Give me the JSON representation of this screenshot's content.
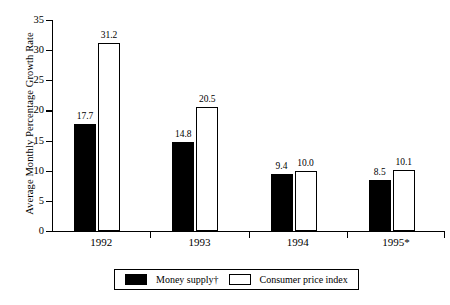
{
  "chart_data": {
    "type": "bar",
    "title": "",
    "xlabel": "",
    "ylabel": "Average Monthly Percentage Growth Rate",
    "ylim": [
      0,
      35
    ],
    "yticks": [
      0,
      5,
      10,
      15,
      20,
      25,
      30,
      35
    ],
    "ytick_labels": [
      "0",
      "5",
      "10",
      "15",
      "20",
      "25",
      "30",
      "35"
    ],
    "grid": false,
    "legend_position": "bottom-center",
    "categories": [
      "1992",
      "1993",
      "1994",
      "1995*"
    ],
    "series": [
      {
        "name": "Money supply†",
        "color": "#000000",
        "style": "filled",
        "values": [
          17.7,
          14.8,
          9.4,
          8.5
        ],
        "labels": [
          "17.7",
          "14.8",
          "9.4",
          "8.5"
        ]
      },
      {
        "name": "Consumer price index",
        "color": "#ffffff",
        "style": "outlined",
        "values": [
          31.2,
          20.5,
          10.0,
          10.1
        ],
        "labels": [
          "31.2",
          "20.5",
          "10.0",
          "10.1"
        ]
      }
    ]
  },
  "axes": {
    "y_title": "Average Monthly Percentage Growth Rate"
  },
  "legend": {
    "items": [
      {
        "label": "Money supply†",
        "swatch": "filled-black-swatch"
      },
      {
        "label": "Consumer price index",
        "swatch": "outlined-white-swatch"
      }
    ]
  }
}
